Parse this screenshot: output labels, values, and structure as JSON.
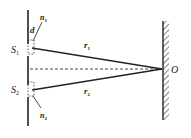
{
  "diagram": {
    "labels": {
      "s1": "S",
      "s1_sub": "1",
      "s2": "S",
      "s2_sub": "2",
      "n1": "n",
      "n1_sub": "1",
      "n2": "n",
      "n2_sub": "2",
      "d": "d",
      "r1": "r",
      "r1_sub": "1",
      "r2": "r",
      "r2_sub": "2",
      "o": "O"
    }
  }
}
